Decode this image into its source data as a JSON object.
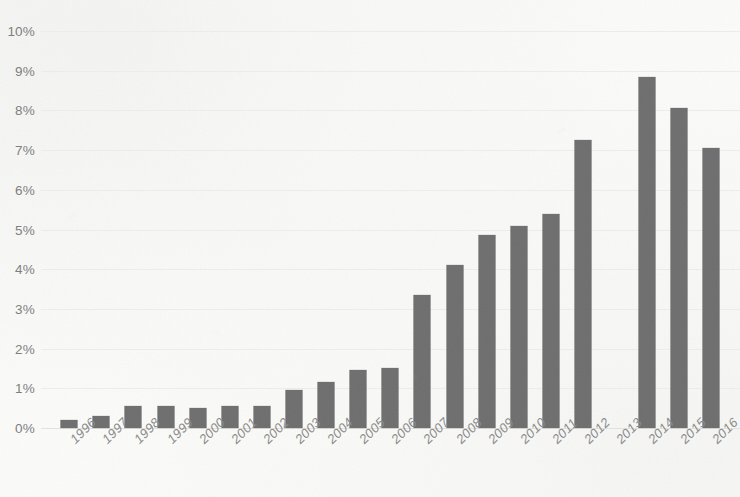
{
  "chart_data": {
    "type": "bar",
    "title": "",
    "subtitle": "",
    "xlabel": "",
    "ylabel": "",
    "orientation": "vertical",
    "grid": true,
    "legend": false,
    "legend_position": "none",
    "bar_color": "#6e6e6e",
    "background_color": "#fbfbfa",
    "gridline_color": "#ededea",
    "tick_label_color": "#7d7d7d",
    "x_tick_rotation": -45,
    "ylim": [
      0,
      10
    ],
    "y_tick_step": 1,
    "y_unit": "%",
    "y_tick_labels": [
      "0%",
      "1%",
      "2%",
      "3%",
      "4%",
      "5%",
      "6%",
      "7%",
      "8%",
      "9%",
      "10%"
    ],
    "y_tick_values": [
      0,
      1,
      2,
      3,
      4,
      5,
      6,
      7,
      8,
      9,
      10
    ],
    "categories": [
      "1996",
      "1997",
      "1998",
      "1999",
      "2000",
      "2001",
      "2002",
      "2003",
      "2004",
      "2005",
      "2006",
      "2007",
      "2008",
      "2009",
      "2010",
      "2011",
      "2012",
      "2013",
      "2014",
      "2015",
      "2016"
    ],
    "values": [
      0.2,
      0.3,
      0.55,
      0.55,
      0.5,
      0.55,
      0.55,
      0.95,
      1.15,
      1.45,
      1.5,
      3.35,
      4.1,
      4.85,
      5.1,
      5.4,
      7.25,
      null,
      8.85,
      8.05,
      7.05
    ],
    "missing_categories": [
      "2013"
    ]
  }
}
